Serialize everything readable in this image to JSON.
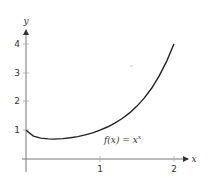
{
  "chart_data": {
    "type": "line",
    "title": "",
    "xlabel": "x",
    "ylabel": "y",
    "xlim": [
      0,
      2.2
    ],
    "ylim": [
      0,
      4.5
    ],
    "x_ticks": [
      "1",
      "2"
    ],
    "y_ticks": [
      "1",
      "2",
      "3",
      "4"
    ],
    "grid": false,
    "legend": null,
    "annotations": [
      {
        "text": "f(x) = x^x",
        "x": 1.05,
        "y": 0.65
      }
    ],
    "series": [
      {
        "name": "f(x) = x^x",
        "x": [
          0.0,
          0.1,
          0.2,
          0.3,
          0.368,
          0.5,
          0.6,
          0.7,
          0.8,
          0.9,
          1.0,
          1.1,
          1.2,
          1.3,
          1.4,
          1.5,
          1.6,
          1.7,
          1.8,
          1.9,
          2.0
        ],
        "values": [
          1.0,
          0.794,
          0.725,
          0.697,
          0.692,
          0.707,
          0.736,
          0.779,
          0.837,
          0.91,
          1.0,
          1.11,
          1.245,
          1.406,
          1.602,
          1.837,
          2.121,
          2.466,
          2.884,
          3.388,
          4.0
        ]
      }
    ],
    "color": "#222222"
  },
  "labels": {
    "x_axis": "x",
    "y_axis": "y",
    "x_tick_1": "1",
    "x_tick_2": "2",
    "y_tick_1": "1",
    "y_tick_2": "2",
    "y_tick_3": "3",
    "y_tick_4": "4",
    "fn_prefix": "f(x) = x",
    "fn_exp": "x"
  }
}
